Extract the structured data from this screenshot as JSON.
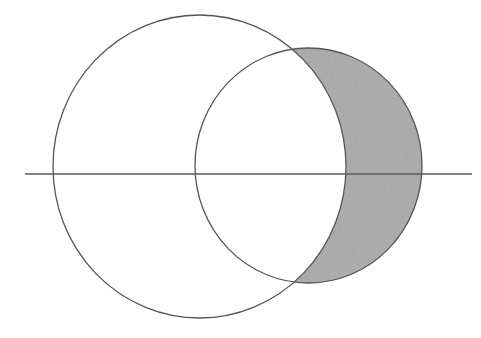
{
  "diagram": {
    "type": "set-difference-venn",
    "colors": {
      "background": "#ffffff",
      "stroke": "#555555",
      "shade_fill": "#a9a9a9",
      "axis_stroke": "#5a5a5a"
    },
    "axis_line": {
      "x1": 25,
      "y1": 174,
      "x2": 472,
      "y2": 174,
      "stroke_width": 1.6
    },
    "big_circle": {
      "cx": 199.5,
      "cy": 166.5,
      "rx": 146.5,
      "ry": 151.5,
      "stroke_width": 1.3
    },
    "small_circle": {
      "cx": 308.5,
      "cy": 165.5,
      "rx": 113.5,
      "ry": 117.5,
      "stroke_width": 1.3
    },
    "shaded_region": "small_circle minus big_circle"
  }
}
